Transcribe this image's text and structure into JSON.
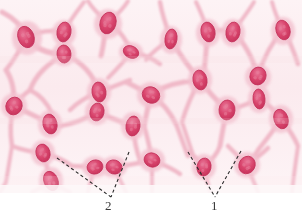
{
  "figure": {
    "name": "mesenchymal-connective-tissue-micrograph",
    "width": 302,
    "height": 223,
    "image_area": {
      "x": 0,
      "y": 0,
      "width": 302,
      "height": 193
    },
    "background_color": "#ffffff"
  },
  "colors": {
    "tissue_background": "#fbeef1",
    "ground_substance": "#f9e8ec",
    "cytoplasm": "#f2c4cf",
    "cytoplasm_edge": "#eab0c0",
    "nucleus_fill": "#d9456d",
    "nucleus_edge": "#c3315a",
    "nucleus_highlight": "#e87d9b",
    "leader_line": "#2b2b2b",
    "label_text": "#3a3a3a"
  },
  "callouts": [
    {
      "id": "2",
      "label": "2",
      "label_x": 105,
      "label_y": 199,
      "vertex": {
        "x": 111,
        "y": 197
      },
      "leaders": [
        {
          "from": {
            "x": 57,
            "y": 158
          },
          "to": {
            "x": 111,
            "y": 197
          }
        },
        {
          "from": {
            "x": 129,
            "y": 152
          },
          "to": {
            "x": 111,
            "y": 197
          }
        }
      ]
    },
    {
      "id": "1",
      "label": "1",
      "label_x": 211,
      "label_y": 199,
      "vertex": {
        "x": 215,
        "y": 197
      },
      "leaders": [
        {
          "from": {
            "x": 188,
            "y": 152
          },
          "to": {
            "x": 215,
            "y": 197
          }
        },
        {
          "from": {
            "x": 241,
            "y": 151
          },
          "to": {
            "x": 215,
            "y": 197
          }
        }
      ]
    }
  ],
  "cells": {
    "description": "Stellate mesenchymal cells forming an anastomosing network with oval nuclei",
    "nuclei": [
      {
        "cx": 26,
        "cy": 37,
        "rx": 8,
        "ry": 11,
        "rot": -20
      },
      {
        "cx": 64,
        "cy": 32,
        "rx": 7,
        "ry": 10,
        "rot": 10
      },
      {
        "cx": 64,
        "cy": 54,
        "rx": 7,
        "ry": 9,
        "rot": -5
      },
      {
        "cx": 108,
        "cy": 23,
        "rx": 8,
        "ry": 11,
        "rot": 15
      },
      {
        "cx": 131,
        "cy": 52,
        "rx": 8,
        "ry": 6,
        "rot": 25
      },
      {
        "cx": 171,
        "cy": 39,
        "rx": 6,
        "ry": 10,
        "rot": 8
      },
      {
        "cx": 208,
        "cy": 32,
        "rx": 7,
        "ry": 10,
        "rot": -12
      },
      {
        "cx": 233,
        "cy": 32,
        "rx": 7,
        "ry": 10,
        "rot": 10
      },
      {
        "cx": 283,
        "cy": 30,
        "rx": 7,
        "ry": 10,
        "rot": -15
      },
      {
        "cx": 99,
        "cy": 92,
        "rx": 7,
        "ry": 10,
        "rot": -8
      },
      {
        "cx": 97,
        "cy": 112,
        "rx": 7,
        "ry": 9,
        "rot": 12
      },
      {
        "cx": 151,
        "cy": 95,
        "rx": 9,
        "ry": 8,
        "rot": 30
      },
      {
        "cx": 200,
        "cy": 80,
        "rx": 7,
        "ry": 10,
        "rot": -10
      },
      {
        "cx": 258,
        "cy": 76,
        "rx": 8,
        "ry": 9,
        "rot": 20
      },
      {
        "cx": 259,
        "cy": 99,
        "rx": 6,
        "ry": 10,
        "rot": -5
      },
      {
        "cx": 14,
        "cy": 106,
        "rx": 8,
        "ry": 9,
        "rot": 25
      },
      {
        "cx": 50,
        "cy": 124,
        "rx": 7,
        "ry": 10,
        "rot": -12
      },
      {
        "cx": 227,
        "cy": 110,
        "rx": 8,
        "ry": 10,
        "rot": 5
      },
      {
        "cx": 281,
        "cy": 119,
        "rx": 7,
        "ry": 10,
        "rot": -18
      },
      {
        "cx": 133,
        "cy": 126,
        "rx": 7,
        "ry": 10,
        "rot": 8
      },
      {
        "cx": 43,
        "cy": 153,
        "rx": 7,
        "ry": 9,
        "rot": -15
      },
      {
        "cx": 152,
        "cy": 160,
        "rx": 8,
        "ry": 7,
        "rot": 20
      },
      {
        "cx": 95,
        "cy": 167,
        "rx": 8,
        "ry": 7,
        "rot": -18
      },
      {
        "cx": 114,
        "cy": 167,
        "rx": 8,
        "ry": 7,
        "rot": 15
      },
      {
        "cx": 51,
        "cy": 181,
        "rx": 7,
        "ry": 10,
        "rot": -22
      },
      {
        "cx": 204,
        "cy": 167,
        "rx": 7,
        "ry": 9,
        "rot": 10
      },
      {
        "cx": 247,
        "cy": 165,
        "rx": 8,
        "ry": 9,
        "rot": 30
      }
    ]
  }
}
